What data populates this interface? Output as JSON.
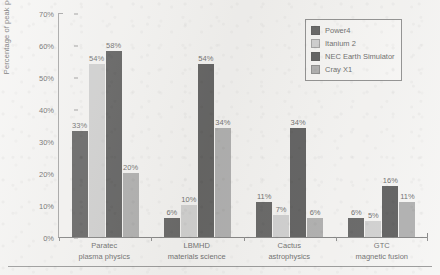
{
  "chart_data": {
    "type": "bar",
    "title": "",
    "subtitle": "",
    "xlabel": "",
    "ylabel": "Percentage of peak performance",
    "ylim": [
      0,
      70
    ],
    "y_tick_labels": [
      "0%",
      "10%",
      "20%",
      "30%",
      "40%",
      "50%",
      "60%",
      "70%"
    ],
    "y_tick_values": [
      0,
      10,
      20,
      30,
      40,
      50,
      60,
      70
    ],
    "grid": false,
    "legend_position": "top-right",
    "categories": [
      "Paratec\nplasma physics",
      "LBMHD\nmaterials science",
      "Cactus\nastrophysics",
      "GTC\nmagnetic fusion"
    ],
    "category_lines": [
      {
        "name": "Paratec",
        "field": "plasma physics"
      },
      {
        "name": "LBMHD",
        "field": "materials science"
      },
      {
        "name": "Cactus",
        "field": "astrophysics"
      },
      {
        "name": "GTC",
        "field": "magnetic fusion"
      }
    ],
    "series": [
      {
        "name": "Power4",
        "color": "#1c1c1c",
        "values": [
          33,
          6,
          11,
          6
        ],
        "labels": [
          "33%",
          "6%",
          "11%",
          "6%"
        ]
      },
      {
        "name": "Itanium 2",
        "color": "#bcbcbc",
        "values": [
          54,
          10,
          7,
          5
        ],
        "labels": [
          "54%",
          "10%",
          "7%",
          "5%"
        ]
      },
      {
        "name": "NEC Earth Simulator",
        "color": "#141414",
        "values": [
          58,
          54,
          34,
          16
        ],
        "labels": [
          "58%",
          "54%",
          "34%",
          "16%"
        ]
      },
      {
        "name": "Cray X1",
        "color": "#8a8a8a",
        "values": [
          20,
          34,
          6,
          11
        ],
        "labels": [
          "20%",
          "34%",
          "6%",
          "11%"
        ]
      }
    ]
  },
  "legend": {
    "items": [
      {
        "label": "Power4"
      },
      {
        "label": "Itanium 2"
      },
      {
        "label": "NEC Earth Simulator"
      },
      {
        "label": "Cray X1"
      }
    ]
  }
}
